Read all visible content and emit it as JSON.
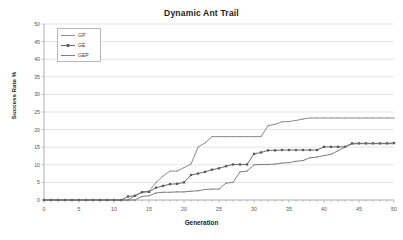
{
  "chart_data": {
    "type": "line",
    "title": "Dynamic Ant Trail",
    "xlabel": "Generation",
    "ylabel": "Success Rate %",
    "xlim": [
      0,
      50
    ],
    "ylim": [
      0,
      50
    ],
    "xticks": [
      0,
      5,
      10,
      15,
      20,
      25,
      30,
      35,
      40,
      45,
      50
    ],
    "yticks": [
      0,
      5,
      10,
      15,
      20,
      25,
      30,
      35,
      40,
      45,
      50
    ],
    "grid": "horizontal",
    "legend_position": "upper-left-inside",
    "x": [
      0,
      1,
      2,
      3,
      4,
      5,
      6,
      7,
      8,
      9,
      10,
      11,
      12,
      13,
      14,
      15,
      16,
      17,
      18,
      19,
      20,
      21,
      22,
      23,
      24,
      25,
      26,
      27,
      28,
      29,
      30,
      31,
      32,
      33,
      34,
      35,
      36,
      37,
      38,
      39,
      40,
      41,
      42,
      43,
      44,
      45,
      46,
      47,
      48,
      49,
      50
    ],
    "series": [
      {
        "name": "GP",
        "color": "#808080",
        "marker": "none",
        "values": [
          0,
          0,
          0,
          0,
          0,
          0,
          0,
          0,
          0,
          0,
          0,
          0,
          0,
          1.2,
          2.3,
          2.5,
          5.0,
          6.8,
          8.2,
          8.2,
          9.2,
          10.2,
          15.0,
          16.2,
          18.0,
          18.0,
          18.0,
          18.0,
          18.0,
          18.0,
          18.0,
          18.0,
          21.1,
          21.5,
          22.2,
          22.3,
          22.6,
          23.0,
          23.3,
          23.3,
          23.3,
          23.3,
          23.3,
          23.3,
          23.3,
          23.3,
          23.3,
          23.3,
          23.3,
          23.3,
          23.3
        ]
      },
      {
        "name": "GE",
        "color": "#595959",
        "marker": "square",
        "values": [
          0,
          0,
          0,
          0,
          0,
          0,
          0,
          0,
          0,
          0,
          0,
          0,
          1.0,
          1.2,
          2.2,
          2.3,
          3.5,
          4.0,
          4.5,
          4.6,
          5.0,
          7.1,
          7.5,
          8.0,
          8.6,
          9.0,
          9.6,
          10.1,
          10.1,
          10.1,
          13.1,
          13.5,
          14.1,
          14.1,
          14.2,
          14.2,
          14.2,
          14.2,
          14.2,
          14.2,
          15.1,
          15.1,
          15.1,
          15.1,
          16.1,
          16.1,
          16.1,
          16.1,
          16.1,
          16.1,
          16.2
        ]
      },
      {
        "name": "GEP",
        "color": "#707070",
        "marker": "none",
        "values": [
          0,
          0,
          0,
          0,
          0,
          0,
          0,
          0,
          0,
          0,
          0,
          0,
          0,
          0,
          1.0,
          1.2,
          2.0,
          2.2,
          2.2,
          2.3,
          2.3,
          2.5,
          2.6,
          3.0,
          3.1,
          3.1,
          4.8,
          5.0,
          8.0,
          8.2,
          10.0,
          10.1,
          10.1,
          10.2,
          10.5,
          10.6,
          11.0,
          11.2,
          12.0,
          12.2,
          12.6,
          13.0,
          14.0,
          15.0,
          15.9,
          16.0,
          16.0,
          16.0,
          16.0,
          16.0,
          16.0
        ]
      }
    ]
  }
}
